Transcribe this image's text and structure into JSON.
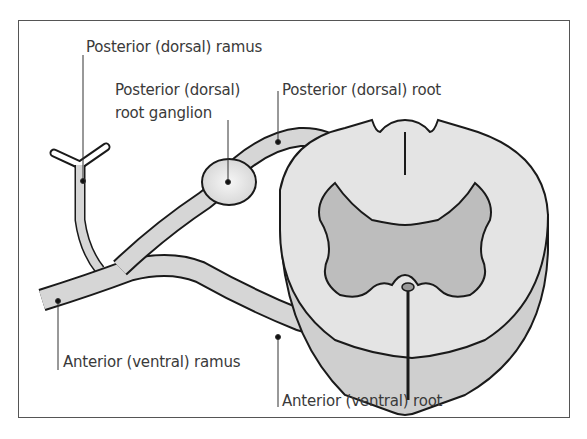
{
  "diagram": {
    "labels": {
      "posterior_ramus": "Posterior (dorsal) ramus",
      "ganglion_line1": "Posterior (dorsal)",
      "ganglion_line2": "root ganglion",
      "posterior_root": "Posterior (dorsal) root",
      "anterior_ramus": "Anterior (ventral) ramus",
      "anterior_root": "Anterior (ventral) root"
    },
    "colors": {
      "outline": "#1a1a1a",
      "white_matter": "#e6e6e6",
      "grey_matter": "#bdbdbd",
      "nerve_fill": "#d6d6d6",
      "label_text": "#3a3a3a",
      "frame": "#444444"
    }
  }
}
